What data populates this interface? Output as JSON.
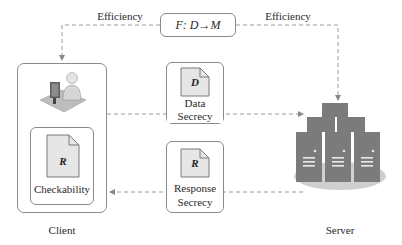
{
  "diagram": {
    "function_box": {
      "text": "F: D→M"
    },
    "edges": {
      "left_label": "Efficiency",
      "right_label": "Efficiency"
    },
    "client": {
      "label": "Client",
      "icon": "user-at-computer-icon",
      "checkability": {
        "doc_letter": "R",
        "label": "Checkability"
      }
    },
    "middle": {
      "data_secrecy": {
        "doc_letter": "D",
        "label_line1": "Data",
        "label_line2": "Secrecy"
      },
      "response_secrecy": {
        "doc_letter": "R",
        "label_line1": "Response",
        "label_line2": "Secrecy"
      }
    },
    "server": {
      "label": "Server",
      "icon": "server-cluster-icon"
    },
    "colors": {
      "line": "#9a9a9a",
      "box_border": "#8a8a8a",
      "doc_fill": "#e6e6e6",
      "server_fill": "#7b7b7b",
      "server_base": "#cfcfcf"
    }
  }
}
